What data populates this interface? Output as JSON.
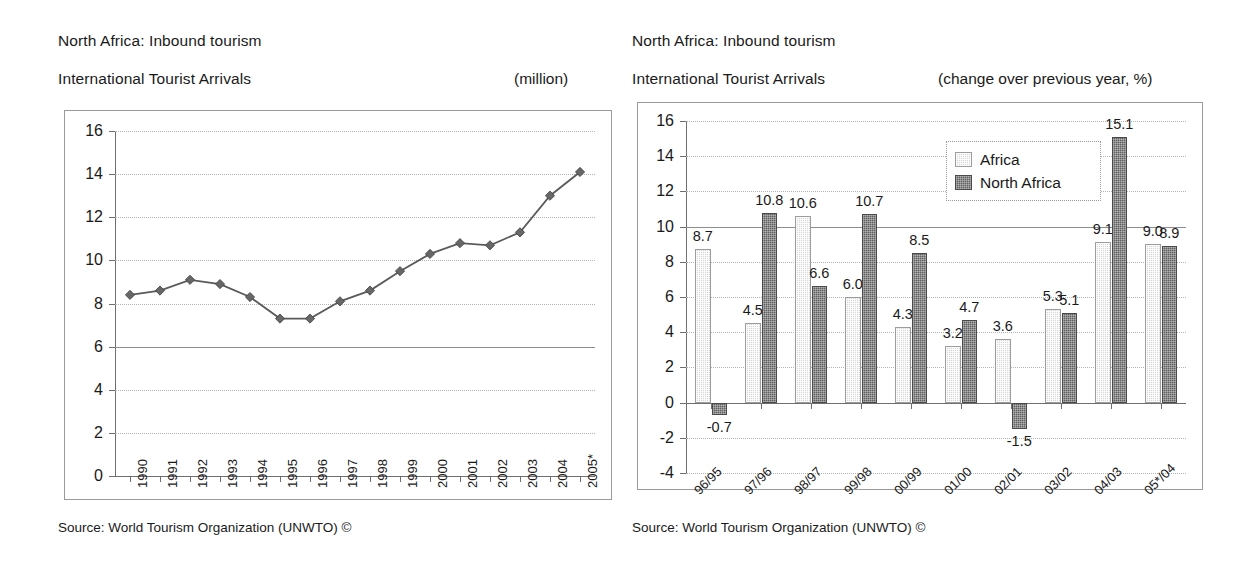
{
  "left": {
    "title_line1": "North Africa: Inbound tourism",
    "title_line2": "International Tourist Arrivals",
    "unit": "(million)",
    "source": "Source: World Tourism Organization (UNWTO) ©"
  },
  "right": {
    "title_line1": "North Africa: Inbound tourism",
    "title_line2": "International Tourist Arrivals",
    "unit": "(change over previous year, %)",
    "source": "Source: World Tourism Organization (UNWTO) ©"
  },
  "colors": {
    "africa": "#d6d6d6",
    "north_africa": "#5f5f5f",
    "axis": "#6f6f6f",
    "grid": "#b4b4b4",
    "frame": "#9a9a9a",
    "text": "#1a1a1a"
  },
  "chart_data": [
    {
      "type": "line",
      "title": "North Africa: Inbound tourism — International Tourist Arrivals",
      "xlabel": "",
      "ylabel": "",
      "unit": "(million)",
      "ylim": [
        0,
        16
      ],
      "yticks": [
        0,
        2,
        4,
        6,
        8,
        10,
        12,
        14,
        16
      ],
      "ytick_labels": [
        "0",
        "2",
        "4",
        "6",
        "8",
        "10",
        "12",
        "14",
        "16"
      ],
      "grid": true,
      "legend": "none",
      "categories": [
        "1990",
        "1991",
        "1992",
        "1993",
        "1994",
        "1995",
        "1996",
        "1997",
        "1998",
        "1999",
        "2000",
        "2001",
        "2002",
        "2003",
        "2004",
        "2005*"
      ],
      "values": [
        8.4,
        8.6,
        9.1,
        8.9,
        8.3,
        7.3,
        7.3,
        8.1,
        8.6,
        9.5,
        10.3,
        10.8,
        10.7,
        11.3,
        13.0,
        14.1
      ],
      "marker": "diamond",
      "source": "Source: World Tourism Organization (UNWTO) ©"
    },
    {
      "type": "bar",
      "title": "North Africa: Inbound tourism — International Tourist Arrivals",
      "xlabel": "",
      "ylabel": "",
      "unit": "(change over previous year, %)",
      "ylim": [
        -4,
        16
      ],
      "yticks": [
        -4,
        -2,
        0,
        2,
        4,
        6,
        8,
        10,
        12,
        14,
        16
      ],
      "ytick_labels": [
        "-4",
        "-2",
        "0",
        "2",
        "4",
        "6",
        "8",
        "10",
        "12",
        "14",
        "16"
      ],
      "grid": true,
      "legend": "inside-top-right",
      "categories": [
        "96/95",
        "97/96",
        "98/97",
        "99/98",
        "00/99",
        "01/00",
        "02/01",
        "03/02",
        "04/03",
        "05*/04"
      ],
      "series": [
        {
          "name": "Africa",
          "values": [
            8.7,
            4.5,
            10.6,
            6.0,
            4.3,
            3.2,
            3.6,
            5.3,
            9.1,
            9.0
          ],
          "labels": [
            "8.7",
            "4.5",
            "10.6",
            "6.0",
            "4.3",
            "3.2",
            "3.6",
            "5.3",
            "9.1",
            "9.0"
          ]
        },
        {
          "name": "North Africa",
          "values": [
            -0.7,
            10.8,
            6.6,
            10.7,
            8.5,
            4.7,
            -1.5,
            5.1,
            15.1,
            8.9
          ],
          "labels": [
            "-0.7",
            "10.8",
            "6.6",
            "10.7",
            "8.5",
            "4.7",
            "-1.5",
            "5.1",
            "15.1",
            "8.9"
          ]
        }
      ],
      "source": "Source: World Tourism Organization (UNWTO) ©"
    }
  ]
}
